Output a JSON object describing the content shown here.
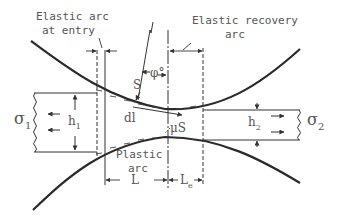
{
  "diagram": {
    "type": "rolling-deformation-zone",
    "labels": {
      "elastic_arc_entry_line1": "Elastic arc",
      "elastic_arc_entry_line2": "at entry",
      "elastic_recovery_line1": "Elastic recovery",
      "elastic_recovery_line2": "arc",
      "plastic_arc_line1": "Plastic",
      "plastic_arc_line2": "arc",
      "normal_force": "S",
      "friction_force": "μS",
      "angle": "φ°",
      "element_length": "dl",
      "entry_thickness": "h",
      "entry_thickness_sub": "1",
      "exit_thickness": "h",
      "exit_thickness_sub": "2",
      "entry_stress": "σ",
      "entry_stress_sub": "1",
      "exit_stress": "σ",
      "exit_stress_sub": "2",
      "plastic_length": "L",
      "elastic_length": "L",
      "elastic_length_sub": "e"
    },
    "colors": {
      "line": "#2a2a2a",
      "text": "#555555",
      "background": "#ffffff"
    }
  }
}
